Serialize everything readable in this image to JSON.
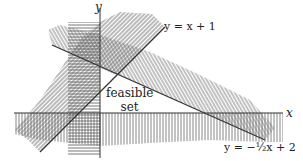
{
  "diagram": {
    "title": "",
    "axes": {
      "x_label": "x",
      "y_label": "y"
    },
    "lines": [
      {
        "name": "line-y-equals-x-plus-1",
        "label": "y = x + 1"
      },
      {
        "name": "line-y-equals-neg-half-x-plus-2",
        "label": "y = −½x + 2"
      }
    ],
    "regions": [
      {
        "name": "feasible-set",
        "label_line1": "feasible",
        "label_line2": "set"
      }
    ],
    "hatching": {
      "left_of_y_axis": "horizontal",
      "below_x_axis": "vertical",
      "above_line_y_eq_neg_half_x_plus_2": "vertical",
      "above_line_y_eq_x_plus_1": "diagonal"
    },
    "colors": {
      "line": "#333333",
      "hatch": "#555555",
      "background": "#ffffff"
    }
  }
}
